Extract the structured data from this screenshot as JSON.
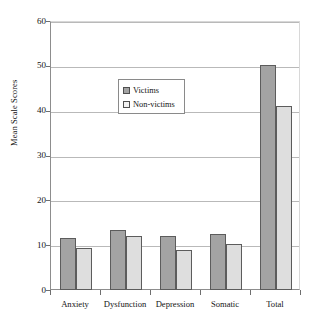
{
  "chart_data": {
    "type": "bar",
    "title": "",
    "xlabel": "",
    "ylabel": "Mean Scale Scores",
    "categories": [
      "Anxiety",
      "Dysfunction",
      "Depression",
      "Somatic",
      "Total"
    ],
    "series": [
      {
        "name": "Victims",
        "color": "#a3a3a3",
        "values": [
          11.6,
          13.5,
          12.0,
          12.6,
          50.4
        ]
      },
      {
        "name": "Non-victims",
        "color": "#dedede",
        "values": [
          9.4,
          12.2,
          9.0,
          10.4,
          41.3
        ]
      }
    ],
    "ylim": [
      0,
      60
    ],
    "yticks": [
      0,
      10,
      20,
      30,
      40,
      50,
      60
    ],
    "ytick_labels": [
      "0",
      "10",
      "20",
      "30",
      "40",
      "50",
      "60"
    ],
    "grid": true,
    "legend_position": "upper center",
    "legend_entries": [
      "Victims",
      "Non-victims"
    ]
  },
  "axis": {
    "y_title": "Mean Scale Scores"
  },
  "legend": {
    "victims_label": "Victims",
    "nonvictims_label": "Non-victims"
  }
}
